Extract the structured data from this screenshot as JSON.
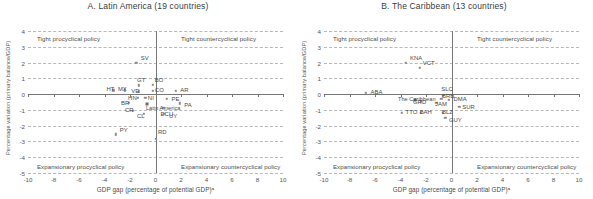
{
  "figure": {
    "panels": [
      {
        "id": "latin-america",
        "title": "A. Latin America (19 countries)",
        "ylabel": "Percentage variation (primary balance/GDP)",
        "xlabel": "GDP gap (percentage of potential GDP)ᵃ",
        "quadrants": {
          "top_left": "Tight procyclical policy",
          "top_right": "Tight countercyclical policy",
          "bottom_left": "Expansionary procyclical policy",
          "bottom_right": "Expansionary countercyclical policy"
        }
      },
      {
        "id": "the-caribbean",
        "title": "B. The Caribbean (13 countries)",
        "ylabel": "Percentage variation (primary balance/GDP)",
        "xlabel": "GDP gap (percentage of potential GDP)ᵃ",
        "quadrants": {
          "top_left": "Tight procyclical policy",
          "top_right": "Tight countercyclical policy",
          "bottom_left": "Expansionary procyclical policy",
          "bottom_right": "Expansionary countercyclical policy"
        }
      }
    ]
  },
  "chart_data": [
    {
      "type": "scatter",
      "title": "A. Latin America (19 countries)",
      "xlabel": "GDP gap (percentage of potential GDP)ᵃ",
      "ylabel": "Percentage variation (primary balance/GDP)",
      "xlim": [
        -10,
        10
      ],
      "ylim": [
        -5,
        4
      ],
      "xticks": [
        -10,
        -8,
        -6,
        -4,
        -2,
        0,
        2,
        4,
        6,
        8,
        10
      ],
      "yticks": [
        4,
        3,
        2,
        1,
        0,
        -1,
        -2,
        -3,
        -4,
        -5
      ],
      "grid": true,
      "legend": "none",
      "points": [
        {
          "label": "SV",
          "x": -1.5,
          "y": 2.0,
          "lx": 0.35,
          "ly": 0.3
        },
        {
          "label": "GT",
          "x": -1.3,
          "y": 0.55,
          "lx": -0.15,
          "ly": 0.34
        },
        {
          "label": "HT",
          "x": -3.3,
          "y": 0.25,
          "lx": -0.55,
          "ly": 0.05
        },
        {
          "label": "MX",
          "x": -2.4,
          "y": 0.25,
          "lx": -0.55,
          "ly": 0.05
        },
        {
          "label": "VE",
          "x": -1.3,
          "y": 0.18,
          "lx": -0.6,
          "ly": 0.02
        },
        {
          "label": "BO",
          "x": -0.2,
          "y": 0.6,
          "lx": 0.15,
          "ly": 0.3
        },
        {
          "label": "CO",
          "x": -0.2,
          "y": 0.22,
          "lx": 0.15,
          "ly": 0.06
        },
        {
          "label": "AR",
          "x": 1.6,
          "y": 0.22,
          "lx": 0.35,
          "ly": 0.06
        },
        {
          "label": "HN",
          "x": -1.4,
          "y": -0.22,
          "lx": -0.75,
          "ly": -0.02
        },
        {
          "label": "NI",
          "x": -0.8,
          "y": -0.25,
          "lx": 0.2,
          "ly": 0.0
        },
        {
          "label": "PE",
          "x": 0.9,
          "y": -0.28,
          "lx": 0.35,
          "ly": 0.0
        },
        {
          "label": "BR",
          "x": -2.1,
          "y": -0.55,
          "lx": -0.6,
          "ly": -0.02
        },
        {
          "label": "PA",
          "x": 1.9,
          "y": -0.58,
          "lx": 0.35,
          "ly": -0.1
        },
        {
          "label": "ECU",
          "x": 0.6,
          "y": -0.85,
          "lx": -0.2,
          "ly": -0.38
        },
        {
          "label": "CR",
          "x": -1.8,
          "y": -1.05,
          "lx": -0.6,
          "ly": 0.02
        },
        {
          "label": "CL",
          "x": -0.9,
          "y": -1.25,
          "lx": -0.55,
          "ly": -0.12
        },
        {
          "label": "UY",
          "x": 0.7,
          "y": -1.25,
          "lx": 0.35,
          "ly": -0.12
        },
        {
          "label": "PY",
          "x": -3.1,
          "y": -2.55,
          "lx": 0.3,
          "ly": 0.3
        },
        {
          "label": "RD",
          "x": 0.0,
          "y": -2.85,
          "lx": 0.2,
          "ly": 0.42
        }
      ],
      "average": {
        "label": "Latin America",
        "x": -0.65,
        "y": -0.6,
        "lx": -0.1,
        "ly": -0.26
      }
    },
    {
      "type": "scatter",
      "title": "B. The Caribbean (13 countries)",
      "xlabel": "GDP gap (percentage of potential GDP)ᵃ",
      "ylabel": "Percentage variation (primary balance/GDP)",
      "xlim": [
        -10,
        10
      ],
      "ylim": [
        -5,
        4
      ],
      "xticks": [
        -10,
        -8,
        -6,
        -4,
        -2,
        0,
        2,
        4,
        6,
        8,
        10
      ],
      "yticks": [
        4,
        3,
        2,
        1,
        0,
        -1,
        -2,
        -3,
        -4,
        -5
      ],
      "grid": true,
      "legend": "none",
      "points": [
        {
          "label": "KNA",
          "x": -3.6,
          "y": 2.0,
          "lx": 0.35,
          "ly": 0.3
        },
        {
          "label": "VCT",
          "x": -2.5,
          "y": 1.65,
          "lx": 0.25,
          "ly": 0.32
        },
        {
          "label": "ABA",
          "x": -6.7,
          "y": 0.1,
          "lx": 0.35,
          "ly": 0.05
        },
        {
          "label": "SLC",
          "x": -0.7,
          "y": -0.1,
          "lx": -0.1,
          "ly": 0.42
        },
        {
          "label": "BRB",
          "x": -0.8,
          "y": -0.3,
          "lx": 0.05,
          "ly": 0.18
        },
        {
          "label": "DMA",
          "x": -0.2,
          "y": -0.35,
          "lx": 0.35,
          "ly": 0.02
        },
        {
          "label": "JAM",
          "x": -1.2,
          "y": -0.55,
          "lx": -0.1,
          "ly": -0.1
        },
        {
          "label": "GRD",
          "x": -2.4,
          "y": -0.45,
          "lx": -0.62,
          "ly": -0.05
        },
        {
          "label": "SUR",
          "x": 0.6,
          "y": -0.8,
          "lx": 0.25,
          "ly": -0.02
        },
        {
          "label": "TTO",
          "x": -3.9,
          "y": -1.2,
          "lx": 0.3,
          "ly": 0.05
        },
        {
          "label": "BAH",
          "x": -2.4,
          "y": -1.2,
          "lx": -0.1,
          "ly": 0.05
        },
        {
          "label": "BLZ",
          "x": -0.7,
          "y": -1.2,
          "lx": -0.05,
          "ly": 0.05
        },
        {
          "label": "GUY",
          "x": -0.5,
          "y": -1.5,
          "lx": 0.3,
          "ly": -0.12
        }
      ],
      "average": {
        "label": "The Caribbean",
        "x": -2.9,
        "y": -0.35,
        "lx": -1.3,
        "ly": 0.02
      }
    }
  ]
}
